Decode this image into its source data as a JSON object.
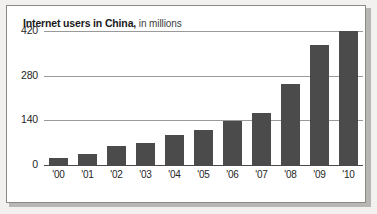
{
  "card": {
    "title_main": "Internet users in China,",
    "title_sub": " in millions"
  },
  "chart_data": {
    "type": "bar",
    "title": "Internet users in China, in millions",
    "subtitle": "in millions",
    "xlabel": "",
    "ylabel": "",
    "categories": [
      "'00",
      "'01",
      "'02",
      "'03",
      "'04",
      "'05",
      "'06",
      "'07",
      "'08",
      "'09",
      "'10"
    ],
    "values": [
      22,
      34,
      60,
      70,
      95,
      111,
      137,
      162,
      253,
      376,
      420
    ],
    "ylim": [
      0,
      420
    ],
    "yticks": [
      0,
      140,
      280,
      420
    ],
    "ytick_labels": [
      "0",
      "140",
      "280",
      "420"
    ],
    "grid": true,
    "legend": "none",
    "bar_color": "#4b4b4b",
    "gridline_color": "#9a9a9a",
    "axis_color": "#4a4a4a",
    "background": "#ffffff"
  }
}
